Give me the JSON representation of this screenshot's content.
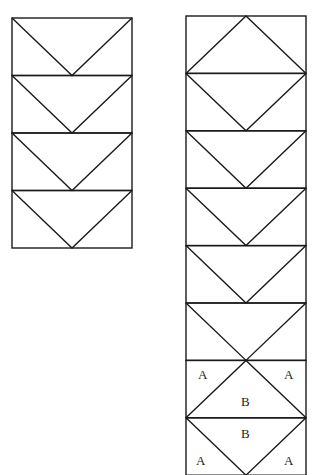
{
  "diagram": {
    "colors": {
      "line": "#1a1a1a",
      "background": "#ffffff",
      "label": "#222222"
    },
    "left_strip": {
      "x": 12,
      "y": 18,
      "width": 120,
      "row_height": 57.5,
      "rows": [
        "V",
        "V",
        "V",
        "V"
      ]
    },
    "right_strip": {
      "x": 186,
      "y": 16,
      "width": 120,
      "row_height": 57.4,
      "rows": [
        "INV",
        "V",
        "V",
        "V",
        "V",
        "V",
        "INV",
        "V"
      ]
    },
    "labels": {
      "a1": "A",
      "a2": "A",
      "b1": "B",
      "b2": "B",
      "a3": "A",
      "a4": "A"
    }
  }
}
